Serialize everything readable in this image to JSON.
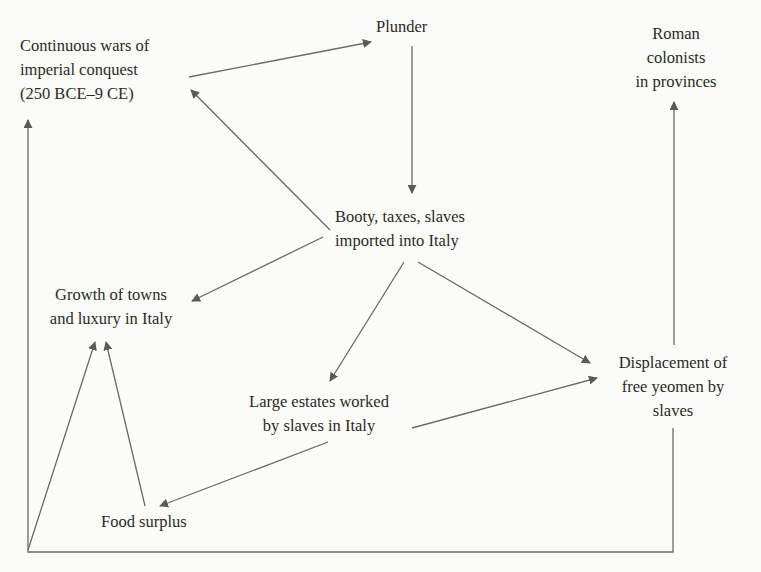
{
  "diagram": {
    "type": "flowchart",
    "colors": {
      "background": "#fbfbf8",
      "text": "#2a2a2a",
      "arrow": "#5a5a5a"
    },
    "nodes": {
      "wars": {
        "lines": [
          "Continuous wars of",
          "imperial conquest",
          "(250 BCE–9 CE)"
        ]
      },
      "plunder": {
        "lines": [
          "Plunder"
        ]
      },
      "colonists": {
        "lines": [
          "Roman",
          "colonists",
          "in provinces"
        ]
      },
      "booty": {
        "lines": [
          "Booty, taxes, slaves",
          "imported into Italy"
        ]
      },
      "towns": {
        "lines": [
          "Growth of towns",
          "and luxury in Italy"
        ]
      },
      "displacement": {
        "lines": [
          "Displacement of",
          "free yeomen by",
          "slaves"
        ]
      },
      "estates": {
        "lines": [
          "Large estates worked",
          "by slaves in Italy"
        ]
      },
      "food": {
        "lines": [
          "Food surplus"
        ]
      }
    },
    "edges": [
      {
        "from": "wars",
        "to": "plunder"
      },
      {
        "from": "plunder",
        "to": "booty"
      },
      {
        "from": "booty",
        "to": "wars"
      },
      {
        "from": "booty",
        "to": "towns"
      },
      {
        "from": "booty",
        "to": "estates"
      },
      {
        "from": "booty",
        "to": "displacement"
      },
      {
        "from": "estates",
        "to": "displacement"
      },
      {
        "from": "estates",
        "to": "food"
      },
      {
        "from": "food",
        "to": "towns"
      },
      {
        "from": "displacement",
        "to": "colonists"
      },
      {
        "from": "displacement",
        "to": "wars",
        "via": "bottom-loop"
      },
      {
        "from": "bottom-loop-corner",
        "to": "towns"
      }
    ]
  }
}
